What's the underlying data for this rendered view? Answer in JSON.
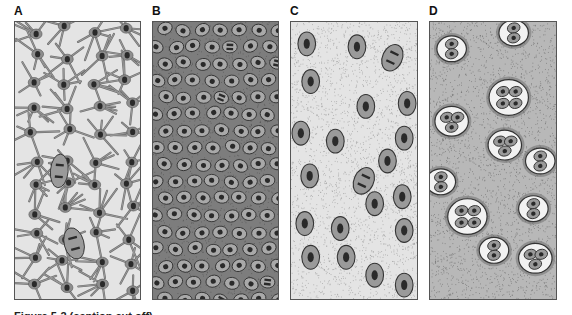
{
  "figure": {
    "panels": [
      {
        "id": "A",
        "label": "A",
        "description": "cells with branching processes in light matrix"
      },
      {
        "id": "B",
        "label": "B",
        "description": "densely packed oval cells in dark matrix"
      },
      {
        "id": "C",
        "label": "C",
        "description": "scattered oval cells in stippled matrix"
      },
      {
        "id": "D",
        "label": "D",
        "description": "cell clusters (isogenous groups) in dark stippled matrix"
      }
    ],
    "caption": "Figure 5-2 (caption cut off)"
  },
  "colors": {
    "cell_fill": "#9a9a9a",
    "nucleus": "#2a2a2a",
    "matrix_light": "#e4e4e4",
    "matrix_dark": "#7d7d7d",
    "outline": "#333333"
  }
}
